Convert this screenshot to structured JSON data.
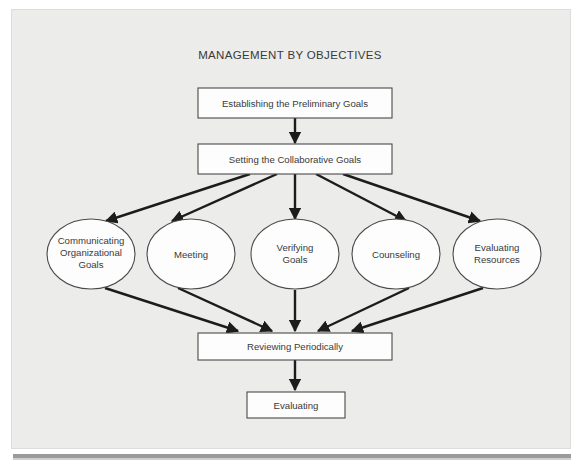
{
  "page": {
    "title": "MANAGEMENT BY OBJECTIVES",
    "background_color": "#ececea",
    "sheet_color": "#ececea",
    "ink_color": "#1c1c1c",
    "node_fill": "#fdfdfd",
    "node_stroke": "#4a4a4a"
  },
  "diagram": {
    "type": "flowchart",
    "title": "MANAGEMENT BY OBJECTIVES",
    "nodes": [
      {
        "id": "establishing",
        "shape": "rect",
        "label": "Establishing the Preliminary Goals"
      },
      {
        "id": "setting",
        "shape": "rect",
        "label": "Setting the Collaborative Goals"
      },
      {
        "id": "communicating",
        "shape": "ellipse",
        "label_line1": "Communicating",
        "label_line2": "Organizational",
        "label_line3": "Goals"
      },
      {
        "id": "meeting",
        "shape": "ellipse",
        "label_line1": "Meeting"
      },
      {
        "id": "verifying",
        "shape": "ellipse",
        "label_line1": "Verifying",
        "label_line2": "Goals"
      },
      {
        "id": "counseling",
        "shape": "ellipse",
        "label_line1": "Counseling"
      },
      {
        "id": "evaluatingres",
        "shape": "ellipse",
        "label_line1": "Evaluating",
        "label_line2": "Resources"
      },
      {
        "id": "reviewing",
        "shape": "rect",
        "label": "Reviewing Periodically"
      },
      {
        "id": "evaluating",
        "shape": "rect",
        "label": "Evaluating"
      }
    ],
    "edges": [
      {
        "from": "establishing",
        "to": "setting"
      },
      {
        "from": "setting",
        "to": "communicating"
      },
      {
        "from": "setting",
        "to": "meeting"
      },
      {
        "from": "setting",
        "to": "verifying"
      },
      {
        "from": "setting",
        "to": "counseling"
      },
      {
        "from": "setting",
        "to": "evaluatingres"
      },
      {
        "from": "communicating",
        "to": "reviewing"
      },
      {
        "from": "meeting",
        "to": "reviewing"
      },
      {
        "from": "verifying",
        "to": "reviewing"
      },
      {
        "from": "counseling",
        "to": "reviewing"
      },
      {
        "from": "evaluatingres",
        "to": "reviewing"
      },
      {
        "from": "reviewing",
        "to": "evaluating"
      }
    ]
  }
}
